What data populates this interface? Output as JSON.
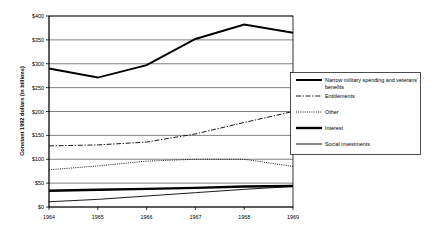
{
  "chart_data": {
    "type": "line",
    "title": "",
    "xlabel": "",
    "ylabel": "Constant 1992 dollars (in billions)",
    "x": [
      1964,
      1965,
      1966,
      1967,
      1968,
      1969
    ],
    "xtick_labels": [
      "1964",
      "1965",
      "1966",
      "1967",
      "1968",
      "1969"
    ],
    "ytick_labels": [
      "$0",
      "$50",
      "$100",
      "$150",
      "$200",
      "$250",
      "$300",
      "$350",
      "$400"
    ],
    "ytick_values": [
      0,
      50,
      100,
      150,
      200,
      250,
      300,
      350,
      400
    ],
    "ylim": [
      0,
      400
    ],
    "xlim": [
      1964,
      1969
    ],
    "grid": "horizontal",
    "legend_position": "right",
    "series": [
      {
        "name": "Narrow military spending and veterans' benefits",
        "style": "solid-thick",
        "values": [
          290,
          271,
          297,
          352,
          382,
          365
        ]
      },
      {
        "name": "Entitlements",
        "style": "dash-dot",
        "values": [
          128,
          130,
          136,
          153,
          177,
          200
        ]
      },
      {
        "name": "Other",
        "style": "dotted",
        "values": [
          78,
          86,
          96,
          100,
          100,
          85
        ]
      },
      {
        "name": "Interest",
        "style": "solid-extrathick",
        "values": [
          34,
          36,
          38,
          40,
          43,
          44
        ]
      },
      {
        "name": "Social investments",
        "style": "solid-thin",
        "values": [
          11,
          16,
          23,
          30,
          37,
          43
        ]
      }
    ]
  },
  "legend": {
    "entries": [
      {
        "label": "Narrow military spending and veterans' benefits",
        "swatch": "solid-thick-line-icon"
      },
      {
        "label": "Entitlements",
        "swatch": "dash-dot-line-icon"
      },
      {
        "label": "Other",
        "swatch": "dotted-line-icon"
      },
      {
        "label": "Interest",
        "swatch": "solid-extrathick-line-icon"
      },
      {
        "label": "Social investments",
        "swatch": "solid-thin-line-icon"
      }
    ]
  },
  "colors": {
    "ink": "#000000",
    "background": "#ffffff",
    "grid": "#000000"
  }
}
